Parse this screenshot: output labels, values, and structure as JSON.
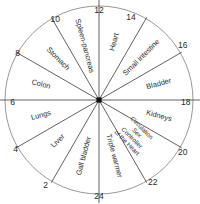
{
  "diagram": {
    "type": "radial-clock",
    "center": {
      "x": 99,
      "y": 100,
      "marker": "filled-square"
    },
    "radius": 94,
    "colors": {
      "rim": "#8c8c8c",
      "spoke": "#3a3a3a",
      "hub": "#111111",
      "text": "#2a2a2a",
      "background": "#ffffff"
    },
    "hour_ticks": [
      {
        "label": "12",
        "angle_deg": 0,
        "x": 99,
        "y": 11,
        "anchor": "middle"
      },
      {
        "label": "14",
        "angle_deg": 30,
        "x": 131,
        "y": 18,
        "anchor": "middle"
      },
      {
        "label": "16",
        "angle_deg": 60,
        "x": 178,
        "y": 46,
        "anchor": "start"
      },
      {
        "label": "18",
        "angle_deg": 90,
        "x": 181,
        "y": 103,
        "anchor": "start"
      },
      {
        "label": "20",
        "angle_deg": 120,
        "x": 178,
        "y": 153,
        "anchor": "start"
      },
      {
        "label": "22",
        "angle_deg": 150,
        "x": 148,
        "y": 183,
        "anchor": "start"
      },
      {
        "label": "24",
        "angle_deg": 180,
        "x": 99,
        "y": 197,
        "anchor": "middle"
      },
      {
        "label": "2",
        "angle_deg": 210,
        "x": 48,
        "y": 186,
        "anchor": "end"
      },
      {
        "label": "4",
        "angle_deg": 240,
        "x": 18,
        "y": 150,
        "anchor": "end"
      },
      {
        "label": "6",
        "angle_deg": 270,
        "x": 15,
        "y": 103,
        "anchor": "end"
      },
      {
        "label": "8",
        "angle_deg": 300,
        "x": 20,
        "y": 54,
        "anchor": "end"
      },
      {
        "label": "10",
        "angle_deg": 330,
        "x": 60,
        "y": 20,
        "anchor": "end"
      }
    ],
    "sectors": [
      {
        "name": "Heart",
        "lines": [
          "Heart"
        ],
        "from_hour": "12",
        "to_hour": "14",
        "mid_angle_deg": 15,
        "label_radius": 60,
        "rotation_deg": 15
      },
      {
        "name": "Small intestine",
        "lines": [
          "Small intestine"
        ],
        "from_hour": "14",
        "to_hour": "16",
        "mid_angle_deg": 45,
        "label_radius": 60,
        "rotation_deg": 45
      },
      {
        "name": "Bladder",
        "lines": [
          "Bladder"
        ],
        "from_hour": "16",
        "to_hour": "18",
        "mid_angle_deg": 75,
        "label_radius": 62,
        "rotation_deg": 75
      },
      {
        "name": "Kidneys",
        "lines": [
          "Kidneys"
        ],
        "from_hour": "18",
        "to_hour": "20",
        "mid_angle_deg": 105,
        "label_radius": 62,
        "rotation_deg": 105
      },
      {
        "name": "Circulation Sex Controller of the Heart",
        "lines": [
          "Circulation",
          "Sex",
          "Controller",
          "of the Heart"
        ],
        "from_hour": "20",
        "to_hour": "22",
        "mid_angle_deg": 135,
        "label_radius": 50,
        "rotation_deg": 135
      },
      {
        "name": "Triple warmer",
        "lines": [
          "Triple warmer"
        ],
        "from_hour": "22",
        "to_hour": "24",
        "mid_angle_deg": 165,
        "label_radius": 58,
        "rotation_deg": 165
      },
      {
        "name": "Gall bladder",
        "lines": [
          "Gall bladder"
        ],
        "from_hour": "24",
        "to_hour": "2",
        "mid_angle_deg": 195,
        "label_radius": 58,
        "rotation_deg": 195
      },
      {
        "name": "Liver",
        "lines": [
          "Liver"
        ],
        "from_hour": "2",
        "to_hour": "4",
        "mid_angle_deg": 225,
        "label_radius": 58,
        "rotation_deg": 225
      },
      {
        "name": "Lungs",
        "lines": [
          "Lungs"
        ],
        "from_hour": "4",
        "to_hour": "6",
        "mid_angle_deg": 255,
        "label_radius": 60,
        "rotation_deg": 255
      },
      {
        "name": "Colon",
        "lines": [
          "Colon"
        ],
        "from_hour": "6",
        "to_hour": "8",
        "mid_angle_deg": 285,
        "label_radius": 60,
        "rotation_deg": 285
      },
      {
        "name": "Stomach",
        "lines": [
          "Stomach"
        ],
        "from_hour": "8",
        "to_hour": "10",
        "mid_angle_deg": 315,
        "label_radius": 58,
        "rotation_deg": 315
      },
      {
        "name": "Spleen-pancreas",
        "lines": [
          "Spleen-pancreas"
        ],
        "from_hour": "10",
        "to_hour": "12",
        "mid_angle_deg": 345,
        "label_radius": 56,
        "rotation_deg": 345
      }
    ]
  }
}
